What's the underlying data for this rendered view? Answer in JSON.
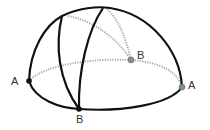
{
  "figure": {
    "colors": {
      "solid_line": "#111111",
      "hidden_line": "#a0a0a0",
      "front_point": "#111111",
      "back_point": "#8a8a8a",
      "label": "#333333"
    },
    "labels": {
      "left_a": "A",
      "right_a": "A",
      "front_b": "B",
      "back_b": "B"
    }
  }
}
